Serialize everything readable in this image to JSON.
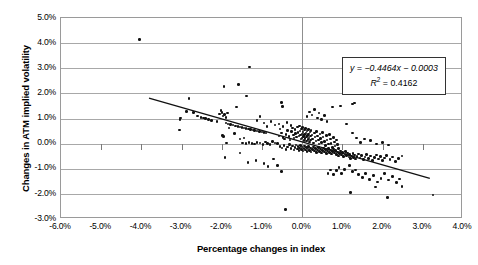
{
  "chart_data": {
    "type": "scatter",
    "title": "",
    "xlabel": "Percentage changes in index",
    "ylabel": "Changes in ATM implied volatility",
    "xlim": [
      -6.0,
      4.0
    ],
    "ylim": [
      -3.0,
      5.0
    ],
    "xticks": [
      "-6.0%",
      "-5.0%",
      "-4.0%",
      "-3.0%",
      "-2.0%",
      "-1.0%",
      "0.0%",
      "1.0%",
      "2.0%",
      "3.0%",
      "4.0%"
    ],
    "xtick_values": [
      -6.0,
      -5.0,
      -4.0,
      -3.0,
      -2.0,
      -1.0,
      0.0,
      1.0,
      2.0,
      3.0,
      4.0
    ],
    "yticks": [
      "5.0%",
      "4.0%",
      "3.0%",
      "2.0%",
      "1.0%",
      "0.0%",
      "-1.0%",
      "-2.0%",
      "-3.0%"
    ],
    "ytick_values": [
      5.0,
      4.0,
      3.0,
      2.0,
      1.0,
      0.0,
      -1.0,
      -2.0,
      -3.0
    ],
    "grid": "horizontal",
    "legend": "none",
    "annotation": {
      "equation": "y = −0.4464x − 0.0003",
      "equation_symbol": "y",
      "equation_body": " = −0.4464x − 0.0003",
      "r_squared_label": "R",
      "r_squared_exp": "2",
      "r_squared_value": " = 0.4162",
      "slope": -0.4464,
      "intercept": -0.0003,
      "r_squared": 0.4162
    },
    "trendline": {
      "x_start": -3.8,
      "y_start": 1.78,
      "x_end": 3.22,
      "y_end": -1.45,
      "color": "#111111"
    },
    "marker": {
      "shape": "circle",
      "color": "#111111",
      "size": 2.6
    },
    "n_points": 284,
    "points": [
      [
        -4.05,
        4.15
      ],
      [
        -1.31,
        3.05
      ],
      [
        -1.95,
        2.28
      ],
      [
        -1.59,
        2.35
      ],
      [
        -2.82,
        1.8
      ],
      [
        -1.38,
        1.9
      ],
      [
        -0.52,
        1.64
      ],
      [
        -0.49,
        1.47
      ],
      [
        -1.63,
        1.46
      ],
      [
        -3.02,
        1.02
      ],
      [
        -3.04,
        0.97
      ],
      [
        -3.05,
        0.55
      ],
      [
        -2.7,
        1.24
      ],
      [
        -2.52,
        1.05
      ],
      [
        -2.46,
        1.02
      ],
      [
        -2.4,
        1.0
      ],
      [
        -2.33,
        0.95
      ],
      [
        -2.25,
        0.93
      ],
      [
        -2.12,
        0.88
      ],
      [
        -2.05,
        1.18
      ],
      [
        -2.02,
        1.33
      ],
      [
        -1.99,
        1.24
      ],
      [
        -1.97,
        1.1
      ],
      [
        -1.93,
        1.15
      ],
      [
        -1.9,
        0.82
      ],
      [
        -1.85,
        0.78
      ],
      [
        -1.78,
        0.76
      ],
      [
        -1.72,
        0.74
      ],
      [
        -1.66,
        0.7
      ],
      [
        -1.6,
        0.68
      ],
      [
        -1.55,
        0.66
      ],
      [
        -1.5,
        0.64
      ],
      [
        -1.45,
        0.62
      ],
      [
        -1.4,
        0.6
      ],
      [
        -1.34,
        0.58
      ],
      [
        -1.28,
        0.56
      ],
      [
        -1.22,
        0.54
      ],
      [
        -1.18,
        0.52
      ],
      [
        -1.12,
        0.5
      ],
      [
        -1.06,
        0.48
      ],
      [
        -1.0,
        0.46
      ],
      [
        -0.95,
        0.44
      ],
      [
        -0.9,
        0.42
      ],
      [
        -1.98,
        0.33
      ],
      [
        -1.96,
        0.29
      ],
      [
        -1.92,
        -0.55
      ],
      [
        -1.88,
        0.02
      ],
      [
        -1.55,
        -0.38
      ],
      [
        -1.48,
        0.03
      ],
      [
        -1.4,
        0.01
      ],
      [
        -1.32,
        0.04
      ],
      [
        -1.25,
        0.0
      ],
      [
        -1.18,
        -0.02
      ],
      [
        -1.12,
        0.05
      ],
      [
        -1.05,
        0.02
      ],
      [
        -0.98,
        -0.03
      ],
      [
        -0.92,
        0.06
      ],
      [
        -0.86,
        0.01
      ],
      [
        -0.8,
        -0.04
      ],
      [
        -0.74,
        0.08
      ],
      [
        -0.68,
        0.03
      ],
      [
        -0.62,
        0.0
      ],
      [
        -0.58,
        0.31
      ],
      [
        -0.55,
        0.58
      ],
      [
        -0.52,
        0.42
      ],
      [
        -0.48,
        0.24
      ],
      [
        -0.44,
        0.18
      ],
      [
        -0.4,
        0.36
      ],
      [
        -0.36,
        0.52
      ],
      [
        -0.33,
        0.28
      ],
      [
        -0.3,
        0.14
      ],
      [
        -0.27,
        0.48
      ],
      [
        -0.24,
        0.62
      ],
      [
        -0.22,
        0.34
      ],
      [
        -0.2,
        0.22
      ],
      [
        -0.18,
        0.56
      ],
      [
        -0.16,
        0.4
      ],
      [
        -0.14,
        0.26
      ],
      [
        -0.12,
        0.66
      ],
      [
        -0.1,
        0.44
      ],
      [
        -0.08,
        0.3
      ],
      [
        -0.06,
        0.7
      ],
      [
        -0.05,
        0.5
      ],
      [
        -0.04,
        0.34
      ],
      [
        -0.03,
        0.18
      ],
      [
        -0.02,
        0.58
      ],
      [
        -0.01,
        0.38
      ],
      [
        0.0,
        0.22
      ],
      [
        0.01,
        0.64
      ],
      [
        0.02,
        0.46
      ],
      [
        0.03,
        0.28
      ],
      [
        0.04,
        0.12
      ],
      [
        0.05,
        0.54
      ],
      [
        0.06,
        0.36
      ],
      [
        0.07,
        0.2
      ],
      [
        0.08,
        0.6
      ],
      [
        0.09,
        0.42
      ],
      [
        0.1,
        0.26
      ],
      [
        0.11,
        0.1
      ],
      [
        0.12,
        0.5
      ],
      [
        0.13,
        0.32
      ],
      [
        0.14,
        0.16
      ],
      [
        0.15,
        0.56
      ],
      [
        0.16,
        0.38
      ],
      [
        0.17,
        0.22
      ],
      [
        0.18,
        0.06
      ],
      [
        0.19,
        0.46
      ],
      [
        0.2,
        0.3
      ],
      [
        0.21,
        0.14
      ],
      [
        0.22,
        0.52
      ],
      [
        0.24,
        0.34
      ],
      [
        0.26,
        0.18
      ],
      [
        0.28,
        0.02
      ],
      [
        0.3,
        0.42
      ],
      [
        0.32,
        0.26
      ],
      [
        0.34,
        0.1
      ],
      [
        0.36,
        0.48
      ],
      [
        0.38,
        0.3
      ],
      [
        0.4,
        0.14
      ],
      [
        0.42,
        -0.02
      ],
      [
        0.44,
        0.38
      ],
      [
        0.46,
        0.2
      ],
      [
        0.48,
        0.04
      ],
      [
        0.5,
        0.44
      ],
      [
        0.52,
        0.26
      ],
      [
        0.55,
        0.08
      ],
      [
        0.58,
        -0.08
      ],
      [
        0.6,
        0.32
      ],
      [
        0.62,
        0.14
      ],
      [
        0.65,
        -0.02
      ],
      [
        0.68,
        0.36
      ],
      [
        0.7,
        0.18
      ],
      [
        0.72,
        0.0
      ],
      [
        0.75,
        -0.16
      ],
      [
        0.78,
        0.24
      ],
      [
        0.8,
        0.06
      ],
      [
        0.82,
        -0.1
      ],
      [
        0.85,
        0.14
      ],
      [
        0.88,
        -0.04
      ],
      [
        0.9,
        -0.2
      ],
      [
        -0.55,
        -0.12
      ],
      [
        -0.5,
        -0.18
      ],
      [
        -0.45,
        -0.08
      ],
      [
        -0.4,
        -0.24
      ],
      [
        -0.36,
        -0.14
      ],
      [
        -0.32,
        -0.04
      ],
      [
        -0.28,
        -0.2
      ],
      [
        -0.24,
        -0.1
      ],
      [
        -0.2,
        -0.26
      ],
      [
        -0.18,
        -0.16
      ],
      [
        -0.15,
        -0.06
      ],
      [
        -0.12,
        -0.22
      ],
      [
        -0.1,
        -0.12
      ],
      [
        -0.08,
        -0.28
      ],
      [
        -0.06,
        -0.18
      ],
      [
        -0.04,
        -0.08
      ],
      [
        -0.02,
        -0.24
      ],
      [
        0.0,
        -0.14
      ],
      [
        0.02,
        -0.3
      ],
      [
        0.04,
        -0.2
      ],
      [
        0.06,
        -0.1
      ],
      [
        0.08,
        -0.26
      ],
      [
        0.1,
        -0.16
      ],
      [
        0.12,
        -0.32
      ],
      [
        0.14,
        -0.22
      ],
      [
        0.16,
        -0.12
      ],
      [
        0.18,
        -0.28
      ],
      [
        0.2,
        -0.18
      ],
      [
        0.22,
        -0.34
      ],
      [
        0.25,
        -0.24
      ],
      [
        0.28,
        -0.14
      ],
      [
        0.3,
        -0.3
      ],
      [
        0.33,
        -0.2
      ],
      [
        0.36,
        -0.36
      ],
      [
        0.38,
        -0.26
      ],
      [
        0.4,
        -0.16
      ],
      [
        0.43,
        -0.32
      ],
      [
        0.46,
        -0.22
      ],
      [
        0.48,
        -0.38
      ],
      [
        0.5,
        -0.28
      ],
      [
        0.53,
        -0.18
      ],
      [
        0.56,
        -0.34
      ],
      [
        0.58,
        -0.24
      ],
      [
        0.6,
        -0.4
      ],
      [
        0.63,
        -0.3
      ],
      [
        0.66,
        -0.2
      ],
      [
        0.68,
        -0.36
      ],
      [
        0.7,
        -0.26
      ],
      [
        0.73,
        -0.42
      ],
      [
        0.76,
        -0.32
      ],
      [
        0.78,
        -0.22
      ],
      [
        0.8,
        -0.38
      ],
      [
        0.83,
        -0.28
      ],
      [
        0.86,
        -0.44
      ],
      [
        0.88,
        -0.34
      ],
      [
        0.9,
        -0.5
      ],
      [
        0.93,
        -0.4
      ],
      [
        0.96,
        -0.3
      ],
      [
        0.98,
        -0.46
      ],
      [
        1.0,
        -0.36
      ],
      [
        1.03,
        -0.52
      ],
      [
        1.06,
        -0.42
      ],
      [
        1.08,
        -0.32
      ],
      [
        1.1,
        -0.48
      ],
      [
        1.13,
        -0.38
      ],
      [
        1.16,
        -0.54
      ],
      [
        1.18,
        -0.44
      ],
      [
        1.2,
        -0.6
      ],
      [
        1.23,
        -0.5
      ],
      [
        1.26,
        -0.4
      ],
      [
        1.28,
        -0.56
      ],
      [
        1.3,
        -0.46
      ],
      [
        1.33,
        -0.62
      ],
      [
        1.36,
        -0.52
      ],
      [
        1.4,
        -0.42
      ],
      [
        1.44,
        -0.58
      ],
      [
        1.48,
        -0.48
      ],
      [
        1.52,
        -0.64
      ],
      [
        1.56,
        -0.54
      ],
      [
        1.6,
        -0.44
      ],
      [
        1.65,
        -0.6
      ],
      [
        1.7,
        -0.5
      ],
      [
        1.75,
        -0.66
      ],
      [
        1.8,
        -0.56
      ],
      [
        1.85,
        -0.46
      ],
      [
        1.9,
        -0.62
      ],
      [
        1.95,
        -0.52
      ],
      [
        2.0,
        -0.68
      ],
      [
        2.05,
        -0.58
      ],
      [
        2.1,
        -0.48
      ],
      [
        2.18,
        -0.64
      ],
      [
        2.25,
        -0.54
      ],
      [
        2.32,
        -0.7
      ],
      [
        2.4,
        -0.6
      ],
      [
        2.48,
        -0.5
      ],
      [
        0.62,
        0.88
      ],
      [
        0.55,
        1.12
      ],
      [
        0.48,
        0.96
      ],
      [
        0.42,
        1.22
      ],
      [
        0.38,
        1.02
      ],
      [
        0.3,
        1.35
      ],
      [
        0.24,
        1.14
      ],
      [
        0.18,
        1.26
      ],
      [
        0.12,
        1.08
      ],
      [
        0.75,
        1.45
      ],
      [
        0.95,
        1.5
      ],
      [
        1.25,
        1.58
      ],
      [
        1.3,
        1.62
      ],
      [
        1.1,
        0.78
      ],
      [
        1.25,
        0.42
      ],
      [
        1.35,
        0.22
      ],
      [
        1.45,
        0.05
      ],
      [
        1.55,
        0.18
      ],
      [
        1.7,
        0.12
      ],
      [
        1.85,
        -0.02
      ],
      [
        2.0,
        0.04
      ],
      [
        2.15,
        -0.06
      ],
      [
        1.18,
        -0.88
      ],
      [
        1.05,
        -1.02
      ],
      [
        0.98,
        -1.18
      ],
      [
        0.92,
        -0.95
      ],
      [
        0.86,
        -1.08
      ],
      [
        0.78,
        -1.22
      ],
      [
        0.7,
        -1.05
      ],
      [
        0.64,
        -1.18
      ],
      [
        1.25,
        -1.12
      ],
      [
        1.32,
        -1.05
      ],
      [
        1.4,
        -1.22
      ],
      [
        1.5,
        -1.35
      ],
      [
        1.58,
        -1.18
      ],
      [
        1.68,
        -1.42
      ],
      [
        1.78,
        -1.28
      ],
      [
        1.88,
        -1.52
      ],
      [
        1.96,
        -1.38
      ],
      [
        2.05,
        -1.18
      ],
      [
        2.15,
        -1.45
      ],
      [
        2.25,
        -1.32
      ],
      [
        2.35,
        -1.55
      ],
      [
        2.42,
        -1.4
      ],
      [
        2.48,
        -1.7
      ],
      [
        1.2,
        -1.95
      ],
      [
        1.82,
        -1.72
      ],
      [
        2.12,
        -2.15
      ],
      [
        3.25,
        -2.05
      ],
      [
        -0.42,
        -2.62
      ],
      [
        -0.52,
        -1.12
      ],
      [
        -0.85,
        -0.92
      ],
      [
        -0.95,
        -0.78
      ],
      [
        -1.15,
        -0.68
      ],
      [
        -1.35,
        -0.74
      ],
      [
        -0.62,
        -0.88
      ],
      [
        -0.72,
        -0.62
      ],
      [
        -1.55,
        0.18
      ],
      [
        -1.45,
        0.22
      ],
      [
        -1.68,
        0.4
      ],
      [
        -1.82,
        0.62
      ],
      [
        -1.9,
        1.05
      ],
      [
        -1.86,
        1.22
      ],
      [
        -2.6,
        1.1
      ],
      [
        -2.88,
        1.28
      ],
      [
        -0.95,
        0.82
      ],
      [
        -1.05,
        1.08
      ],
      [
        -1.12,
        0.92
      ],
      [
        -0.88,
        0.68
      ],
      [
        -0.78,
        0.88
      ],
      [
        -0.68,
        0.74
      ],
      [
        -0.58,
        0.78
      ],
      [
        -0.48,
        0.68
      ],
      [
        -0.38,
        0.84
      ],
      [
        -0.28,
        0.72
      ]
    ]
  },
  "figure": {
    "axis_color": "#9a9a9a",
    "grid_color": "#a8a8a8",
    "marker_color": "#111111"
  }
}
